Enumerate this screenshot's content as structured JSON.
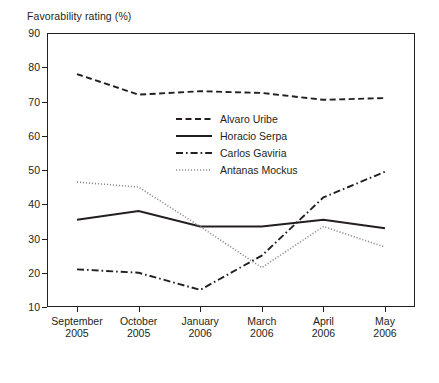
{
  "chart": {
    "axis_title": "Favorability rating (%)",
    "ylabel": "Favorability rating (%)"
  },
  "yticks": [
    {
      "value": 90,
      "label": "90"
    },
    {
      "value": 80,
      "label": "80"
    },
    {
      "value": 70,
      "label": "70"
    },
    {
      "value": 60,
      "label": "60"
    },
    {
      "value": 50,
      "label": "50"
    },
    {
      "value": 40,
      "label": "40"
    },
    {
      "value": 30,
      "label": "30"
    },
    {
      "value": 20,
      "label": "20"
    },
    {
      "value": 10,
      "label": "10"
    }
  ],
  "xticks": [
    {
      "month": "September",
      "year": "2005"
    },
    {
      "month": "October",
      "year": "2005"
    },
    {
      "month": "January",
      "year": "2006"
    },
    {
      "month": "March",
      "year": "2006"
    },
    {
      "month": "April",
      "year": "2006"
    },
    {
      "month": "May",
      "year": "2006"
    }
  ],
  "legend": [
    {
      "label": "Alvaro Uribe",
      "style": "dashed"
    },
    {
      "label": "Horacio Serpa",
      "style": "solid"
    },
    {
      "label": "Carlos Gaviria",
      "style": "dash-dot"
    },
    {
      "label": "Antanas Mockus",
      "style": "dotted"
    }
  ],
  "chart_data": {
    "type": "line",
    "title": "",
    "xlabel": "",
    "ylabel": "Favorability rating (%)",
    "ylim": [
      10,
      90
    ],
    "ytick_step": 10,
    "grid": false,
    "legend_position": "inside-upper-center",
    "categories": [
      "September 2005",
      "October 2005",
      "January 2006",
      "March 2006",
      "April 2006",
      "May 2006"
    ],
    "series": [
      {
        "name": "Alvaro Uribe",
        "style": "dashed",
        "color": "#231f20",
        "values": [
          78,
          72,
          73,
          72.5,
          70.5,
          71
        ]
      },
      {
        "name": "Horacio Serpa",
        "style": "solid",
        "color": "#231f20",
        "values": [
          35.5,
          38,
          33.5,
          33.5,
          35.5,
          33
        ]
      },
      {
        "name": "Carlos Gaviria",
        "style": "dash-dot",
        "color": "#231f20",
        "values": [
          21,
          20,
          15,
          25,
          42,
          49.5
        ]
      },
      {
        "name": "Antanas Mockus",
        "style": "dotted",
        "color": "#8a8a8a",
        "values": [
          46.5,
          45,
          33.5,
          21.5,
          33.5,
          27.5
        ]
      }
    ]
  }
}
